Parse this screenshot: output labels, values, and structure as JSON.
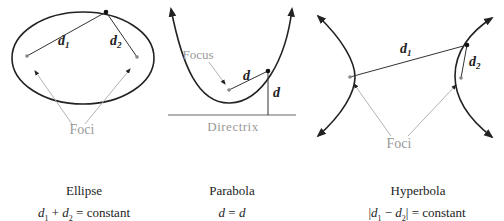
{
  "colors": {
    "curve": "#222222",
    "segment": "#333333",
    "annotation": "#999999",
    "point": "#111111",
    "focus": "#888888"
  },
  "ellipse": {
    "name": "Ellipse",
    "equation": "d₁ + d₂ = constant",
    "eq_parts": {
      "a": "d",
      "a_sub": "1",
      "op": " + ",
      "b": "d",
      "b_sub": "2",
      "rhs": " = constant"
    },
    "labels": {
      "d1": "d",
      "d1_sub": "1",
      "d2": "d",
      "d2_sub": "2",
      "foci": "Foci"
    }
  },
  "parabola": {
    "name": "Parabola",
    "equation": "d = d",
    "eq_parts": {
      "a": "d",
      "op": " = ",
      "b": "d"
    },
    "labels": {
      "d_focus": "d",
      "d_directrix": "d",
      "focus": "Focus",
      "directrix": "Directrix"
    }
  },
  "hyperbola": {
    "name": "Hyperbola",
    "equation": "|d₁ − d₂| = constant",
    "eq_parts": {
      "bar_l": "|",
      "a": "d",
      "a_sub": "1",
      "op": " − ",
      "b": "d",
      "b_sub": "2",
      "bar_r": "|",
      "rhs": " = constant"
    },
    "labels": {
      "d1": "d",
      "d1_sub": "1",
      "d2": "d",
      "d2_sub": "2",
      "foci": "Foci"
    }
  }
}
